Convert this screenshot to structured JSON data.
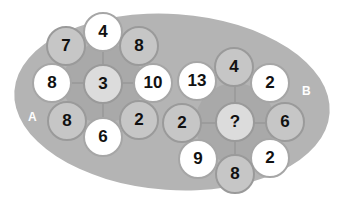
{
  "puzzle": {
    "groups": [
      {
        "label": "A",
        "center": "3",
        "outer": [
          "4",
          "8",
          "10",
          "2",
          "6",
          "8",
          "8",
          "7"
        ]
      },
      {
        "label": "B",
        "center": "?",
        "outer": [
          "4",
          "2",
          "6",
          "2",
          "8",
          "9",
          "2",
          "13"
        ]
      }
    ]
  },
  "colors": {
    "background": "#ffffff",
    "ellipse": "#b4b4b4",
    "grey_node": "#c6c6c6",
    "white_node": "#ffffff",
    "center_node": "#dcdcdc"
  }
}
